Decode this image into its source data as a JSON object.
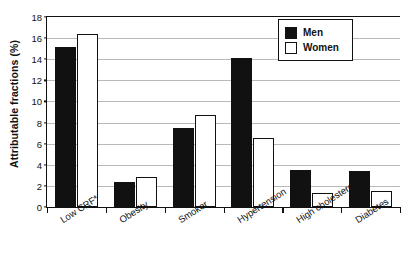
{
  "chart_data": {
    "type": "bar",
    "title": "",
    "xlabel": "",
    "ylabel": "Attributable fractions (%)",
    "categories": [
      "Low CRF*",
      "Obesity",
      "Smoker",
      "Hypertension",
      "High cholesterol",
      "Diabetes"
    ],
    "series": [
      {
        "name": "Men",
        "color": "#111111",
        "values": [
          15.2,
          2.4,
          7.5,
          14.1,
          3.5,
          3.4
        ]
      },
      {
        "name": "Women",
        "color": "#ffffff",
        "values": [
          16.4,
          2.85,
          8.7,
          6.5,
          1.3,
          1.5
        ]
      }
    ],
    "ylim": [
      0,
      18
    ],
    "yticks": [
      0,
      2,
      4,
      6,
      8,
      10,
      12,
      14,
      16,
      18
    ],
    "ytick_labels": [
      "0",
      "2",
      "4",
      "6",
      "8",
      "10",
      "12",
      "14",
      "16",
      "18"
    ],
    "grid": true,
    "grid_axis": "y",
    "legend_position": "top-right",
    "legend": [
      "Men",
      "Women"
    ]
  }
}
